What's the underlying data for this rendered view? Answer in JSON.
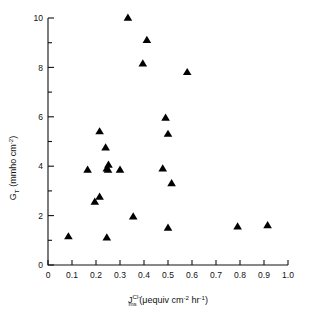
{
  "figure": {
    "background_color": "#ffffff",
    "marker_color": "#000000",
    "axis_color": "#111111"
  },
  "axes": {
    "y": {
      "label_main": "G",
      "label_sub": "T",
      "label_units_open": " (mmho  cm",
      "label_units_sup": "-2",
      "label_units_close": ")",
      "ticks_major": [
        "0",
        "2",
        "4",
        "6",
        "8",
        "10"
      ]
    },
    "x": {
      "label_main": "J",
      "label_sup": "Cl",
      "label_sup_charge": "-",
      "label_sub": "ms",
      "label_units_open": " (",
      "label_units_mu": "μ",
      "label_units_text1": "equiv  cm",
      "label_units_sup1": "-2",
      "label_units_text2": "  hr",
      "label_units_sup2": "-1",
      "label_units_close": ")",
      "ticks_major": [
        "0",
        "0.1",
        "0.2",
        "0.3",
        "0.4",
        "0.5",
        "0.6",
        "0.7",
        "0.8",
        "0.9",
        "1.0"
      ]
    }
  },
  "chart_data": {
    "type": "scatter",
    "title": "",
    "xlabel": "J_ms^Cl- (μequiv cm-2 hr-1)",
    "ylabel": "G_T (mmho cm-2)",
    "xlim": [
      0,
      1.0
    ],
    "ylim": [
      0,
      10
    ],
    "xticks": [
      0,
      0.1,
      0.2,
      0.3,
      0.4,
      0.5,
      0.6,
      0.7,
      0.8,
      0.9,
      1.0
    ],
    "yticks": [
      0,
      2,
      4,
      6,
      8,
      10
    ],
    "x_minor_tick_count": 0,
    "y_minor_ticks": [
      1,
      3,
      5,
      7,
      9
    ],
    "grid": false,
    "legend": null,
    "marker": "triangle-up",
    "series": [
      {
        "name": "G_T vs J_ms Cl-",
        "points": [
          [
            0.085,
            1.15
          ],
          [
            0.165,
            3.85
          ],
          [
            0.195,
            2.55
          ],
          [
            0.215,
            2.75
          ],
          [
            0.215,
            5.4
          ],
          [
            0.24,
            4.75
          ],
          [
            0.245,
            1.1
          ],
          [
            0.245,
            3.9
          ],
          [
            0.25,
            3.85
          ],
          [
            0.252,
            4.05
          ],
          [
            0.3,
            3.85
          ],
          [
            0.333,
            10.0
          ],
          [
            0.355,
            1.95
          ],
          [
            0.395,
            8.15
          ],
          [
            0.412,
            9.1
          ],
          [
            0.478,
            3.9
          ],
          [
            0.49,
            5.95
          ],
          [
            0.5,
            1.5
          ],
          [
            0.5,
            5.3
          ],
          [
            0.515,
            3.3
          ],
          [
            0.58,
            7.8
          ],
          [
            0.79,
            1.55
          ],
          [
            0.915,
            1.6
          ]
        ]
      }
    ]
  }
}
